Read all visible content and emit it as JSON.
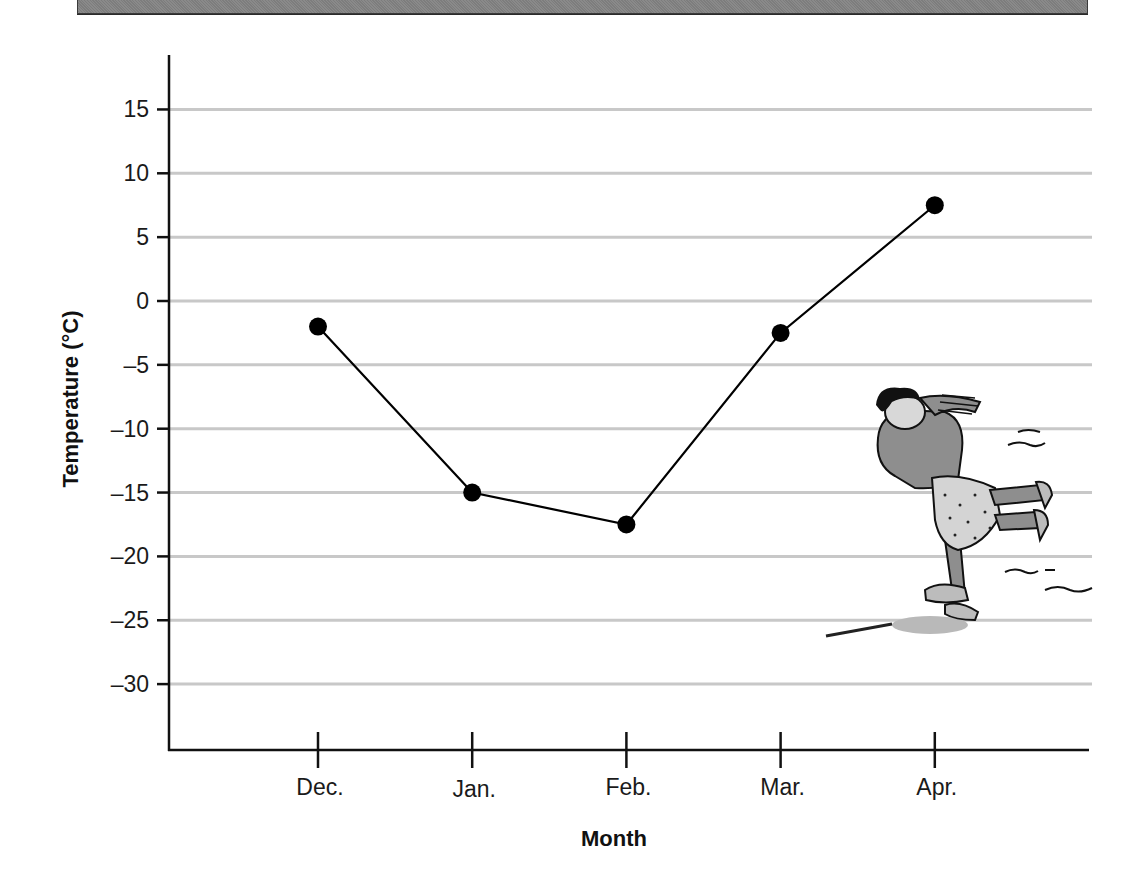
{
  "banner": {
    "color": "#848484"
  },
  "chart_data": {
    "type": "line",
    "title": "",
    "xlabel": "Month",
    "ylabel": "Temperature (°C)",
    "categories": [
      "Dec.",
      "Jan.",
      "Feb.",
      "Mar.",
      "Apr."
    ],
    "series": [
      {
        "name": "Temperature",
        "values": [
          -2,
          -15,
          -17.5,
          -2.5,
          7.5
        ],
        "marker": "filled-circle",
        "color": "#000000"
      }
    ],
    "yticks": [
      15,
      10,
      5,
      0,
      -5,
      -10,
      -15,
      -20,
      -25,
      -30
    ],
    "ytick_labels": [
      "15",
      "10",
      "5",
      "0",
      "–5",
      "–10",
      "–15",
      "–20",
      "–25",
      "–30"
    ],
    "ylim": [
      -35,
      20
    ],
    "grid": true,
    "grid_color": "#c8c8c8",
    "legend": "none",
    "illustration": "ice-skater"
  }
}
